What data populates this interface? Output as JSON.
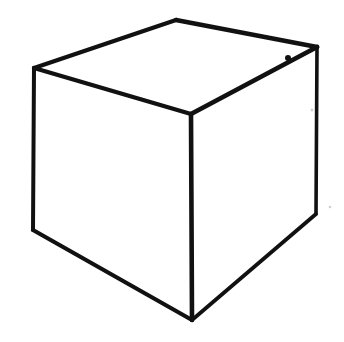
{
  "figure": {
    "style": "hand-drawn line art",
    "background_color": "#ffffff",
    "ink_color": "#111111",
    "canvas": {
      "width": 344,
      "height": 342
    },
    "text_content": "",
    "labels": []
  },
  "geometry": {
    "vertices": {
      "top_back": {
        "name": "top-back-vertex",
        "x": 176,
        "y": 20
      },
      "top_left": {
        "name": "top-left-vertex",
        "x": 34,
        "y": 68
      },
      "top_right": {
        "name": "top-right-vertex",
        "x": 317,
        "y": 47
      },
      "center_front_top": {
        "name": "center-front-top-vertex",
        "x": 191,
        "y": 114
      },
      "bottom_left": {
        "name": "bottom-left-vertex",
        "x": 33,
        "y": 230
      },
      "bottom_right": {
        "name": "bottom-right-vertex",
        "x": 316,
        "y": 214
      },
      "bottom_front": {
        "name": "bottom-front-vertex",
        "x": 192,
        "y": 320
      }
    },
    "faces": {
      "top": "34,68 176,20 317,47 191,114",
      "left": "34,68 191,114 192,320 33,230",
      "right": "191,114 317,47 316,214 192,320"
    },
    "edges": [
      {
        "name": "top-back-left-edge",
        "path": "M 34,68 L 176,20",
        "width": 4.2
      },
      {
        "name": "top-back-right-edge",
        "path": "M 176,20 L 317,47",
        "width": 4.6
      },
      {
        "name": "top-front-left-edge",
        "path": "M 34,68 L 191,114",
        "width": 4.4
      },
      {
        "name": "top-front-right-edge",
        "path": "M 191,114 L 317,47",
        "width": 4.8
      },
      {
        "name": "left-vertical-edge",
        "path": "M 34,68 L 33,230",
        "width": 4.0
      },
      {
        "name": "center-vertical-edge",
        "path": "M 191,114 L 192,320",
        "width": 4.6
      },
      {
        "name": "right-vertical-edge",
        "path": "M 317,47 L 316,214",
        "width": 3.6
      },
      {
        "name": "bottom-left-edge",
        "path": "M 33,230 L 192,320",
        "width": 4.2
      },
      {
        "name": "bottom-right-edge",
        "path": "M 192,320 L 316,214",
        "width": 3.8
      }
    ],
    "artifacts": [
      {
        "name": "ink-kink-top-right",
        "x": 288,
        "y": 58,
        "r": 3.0,
        "color": "#111111"
      },
      {
        "name": "paper-speck-right",
        "x": 312,
        "y": 110,
        "r": 1.4,
        "color": "#d2d2d2"
      },
      {
        "name": "paper-speck-lower-right",
        "x": 330,
        "y": 207,
        "r": 1.3,
        "color": "#d0d0d0"
      }
    ]
  }
}
